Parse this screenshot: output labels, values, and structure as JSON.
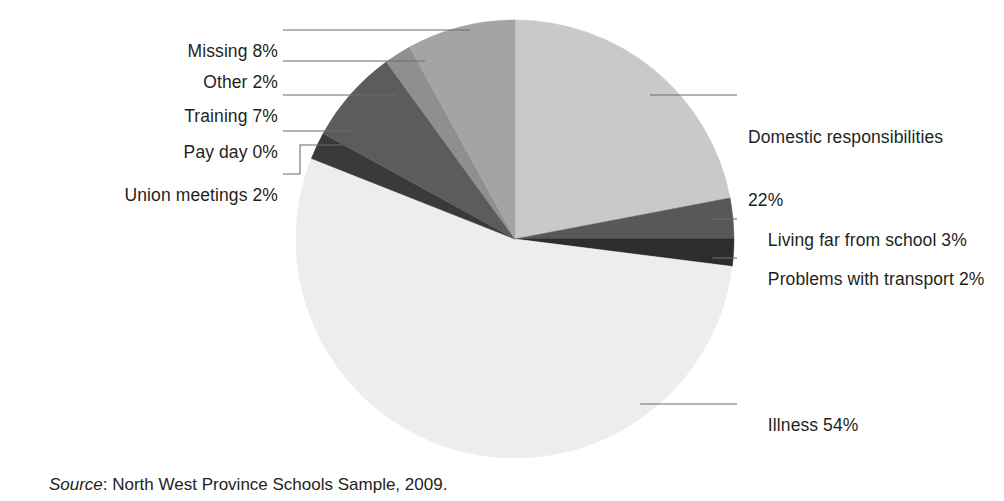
{
  "figure": {
    "source_prefix": "Source",
    "source_text": ": North West Province Schools Sample, 2009."
  },
  "chart_data": {
    "type": "pie",
    "title": "",
    "xlabel": "",
    "ylabel": "",
    "legend_position": "callout-labels",
    "grid": false,
    "unit": "%",
    "start_angle_deg": 0,
    "direction": "clockwise",
    "categories": [
      "Domestic responsibilities",
      "Living far from school",
      "Problems with transport",
      "Illness",
      "Union meetings",
      "Pay day",
      "Training",
      "Other",
      "Missing"
    ],
    "values": [
      22,
      3,
      2,
      54,
      2,
      0,
      7,
      2,
      8
    ],
    "colors": [
      "#c9c9c9",
      "#585858",
      "#2d2d2d",
      "#ededed",
      "#3a3a3a",
      "#5f5f5f",
      "#5c5c5c",
      "#8f8f8f",
      "#a4a4a4"
    ],
    "labels": [
      {
        "name": "domestic-responsibilities",
        "line1": "Domestic responsibilities",
        "line2": "22%",
        "text": "Domestic responsibilities 22%"
      },
      {
        "name": "living-far-from-school",
        "line1": "Living far from school 3%",
        "line2": "",
        "text": "Living far from school 3%"
      },
      {
        "name": "problems-with-transport",
        "line1": "Problems with transport 2%",
        "line2": "",
        "text": "Problems with transport 2%"
      },
      {
        "name": "illness",
        "line1": "Illness 54%",
        "line2": "",
        "text": "Illness 54%"
      },
      {
        "name": "union-meetings",
        "line1": "Union meetings 2%",
        "line2": "",
        "text": "Union meetings 2%"
      },
      {
        "name": "pay-day",
        "line1": "Pay day 0%",
        "line2": "",
        "text": "Pay day 0%"
      },
      {
        "name": "training",
        "line1": "Training 7%",
        "line2": "",
        "text": "Training 7%"
      },
      {
        "name": "other",
        "line1": "Other 2%",
        "line2": "",
        "text": "Other 2%"
      },
      {
        "name": "missing",
        "line1": "Missing 8%",
        "line2": "",
        "text": "Missing 8%"
      }
    ]
  }
}
